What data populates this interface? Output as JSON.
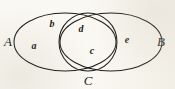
{
  "figure": {
    "kind": "venn-diagram",
    "background_color": "#faf8f2",
    "stroke_color": "#1c1a17",
    "label_color": "#1c1a17",
    "width": 175,
    "height": 89
  },
  "sets": [
    {
      "id": "A",
      "label": "A",
      "shape": "ellipse",
      "cx": 65,
      "cy": 42,
      "rx": 51,
      "ry": 29,
      "label_x": 8,
      "label_y": 41
    },
    {
      "id": "B",
      "label": "B",
      "shape": "ellipse",
      "cx": 111,
      "cy": 42,
      "rx": 51,
      "ry": 29,
      "label_x": 161,
      "label_y": 41
    },
    {
      "id": "C",
      "label": "C",
      "shape": "circle",
      "cx": 88,
      "cy": 42,
      "rx": 29,
      "ry": 29,
      "label_x": 88,
      "label_y": 80
    }
  ],
  "regions": [
    {
      "id": "a",
      "label": "a",
      "x": 34,
      "y": 46,
      "belongs_to": "A only"
    },
    {
      "id": "b",
      "label": "b",
      "x": 52,
      "y": 24,
      "belongs_to": "A and C"
    },
    {
      "id": "d",
      "label": "d",
      "x": 81,
      "y": 29,
      "belongs_to": "A and B and C"
    },
    {
      "id": "c",
      "label": "c",
      "x": 92,
      "y": 51,
      "belongs_to": "B and C"
    },
    {
      "id": "e",
      "label": "e",
      "x": 127,
      "y": 40,
      "belongs_to": "B only"
    }
  ]
}
